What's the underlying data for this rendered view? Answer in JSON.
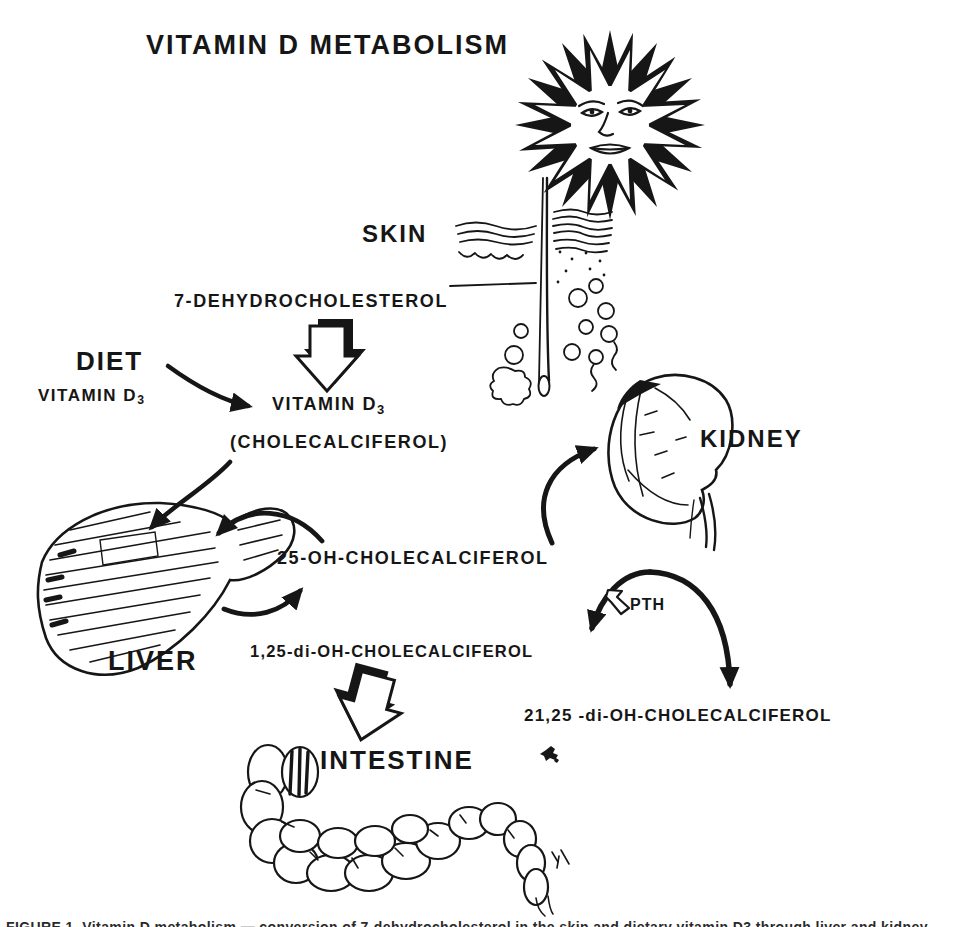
{
  "title": "VITAMIN D METABOLISM",
  "organs": {
    "skin": "SKIN",
    "kidney": "KIDNEY",
    "liver": "LIVER",
    "intestine": "INTESTINE"
  },
  "source": {
    "diet_label": "DIET",
    "diet_compound": {
      "base": "VITAMIN D",
      "sub": "3"
    }
  },
  "compounds": {
    "precursor": "7-DEHYDROCHOLESTEROL",
    "vitamin_d3": {
      "base": "VITAMIN D",
      "sub": "3"
    },
    "vitamin_d3_synonym": "(CHOLECALCIFEROL)",
    "calcidiol": "25-OH-CHOLECALCIFEROL",
    "calcitriol": "1,25-di-OH-CHOLECALCIFEROL",
    "alt_metabolite": "21,25 -di-OH-CHOLECALCIFEROL",
    "hormone": "PTH"
  },
  "illustrations": {
    "sun": "sun with face (UV light)",
    "skin": "skin cross-section with hair follicle",
    "kidney": "kidney with ureter",
    "liver": "liver",
    "intestine": "large intestine"
  },
  "caption_fragment": "FIGURE 1. Vitamin D metabolism — conversion of 7-dehydrocholesterol in the skin and dietary vitamin D3 through liver and kidney hydroxylation to active metabolites.",
  "colors": {
    "ink": "#161616",
    "paper": "#ffffff"
  }
}
